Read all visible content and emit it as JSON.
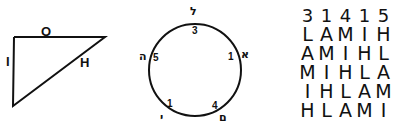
{
  "triangle": {
    "labels": {
      "top": "O",
      "left": "I",
      "hypotenuse": "H"
    }
  },
  "circle": {
    "points": [
      {
        "position": "top",
        "letter": "ל",
        "number": "3"
      },
      {
        "position": "right",
        "letter": "א",
        "number": "1"
      },
      {
        "position": "bottom-right",
        "letter": "ם",
        "number": "4"
      },
      {
        "position": "bottom-left",
        "letter": "י",
        "number": "1"
      },
      {
        "position": "left",
        "letter": "ה",
        "number": "5"
      }
    ]
  },
  "grid": {
    "header": [
      "3",
      "1",
      "4",
      "1",
      "5"
    ],
    "rows": [
      [
        "L",
        "A",
        "M",
        "I",
        "H"
      ],
      [
        "A",
        "M",
        "I",
        "H",
        "L"
      ],
      [
        "M",
        "I",
        "H",
        "L",
        "A"
      ],
      [
        "I",
        "H",
        "L",
        "A",
        "M"
      ],
      [
        "H",
        "L",
        "A",
        "M",
        "I"
      ]
    ]
  },
  "colors": {
    "ink": "#111111",
    "background": "#ffffff"
  }
}
